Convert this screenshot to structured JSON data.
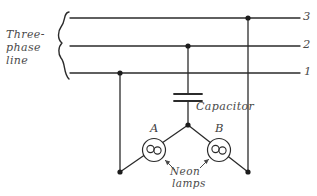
{
  "diagram": {
    "style": "hand-drawn line schematic",
    "background_color": "#ffffff",
    "ink_color": "#2b2b2b",
    "text_color": "#4a4a4a",
    "labels": {
      "three_phase_line_1": "Three-",
      "three_phase_line_2": "phase",
      "three_phase_line_3": "line",
      "terminal_3": "3",
      "terminal_2": "2",
      "terminal_1": "1",
      "capacitor": "Capacitor",
      "lamp_a": "A",
      "lamp_b": "B",
      "neon_lamps_line_1": "Neon",
      "neon_lamps_line_2": "lamps"
    },
    "components": [
      {
        "name": "capacitor",
        "type": "capacitor",
        "label": "Capacitor",
        "connects": [
          "line-2",
          "star-node"
        ]
      },
      {
        "name": "neon-lamp-a",
        "type": "neon-lamp",
        "label": "A",
        "connects": [
          "star-node",
          "line-1"
        ]
      },
      {
        "name": "neon-lamp-b",
        "type": "neon-lamp",
        "label": "B",
        "connects": [
          "star-node",
          "line-3"
        ]
      }
    ],
    "bus_lines": [
      {
        "name": "line-3",
        "label": "3",
        "y": 18,
        "tap_x": 248
      },
      {
        "name": "line-2",
        "label": "2",
        "y": 46,
        "tap_x": 188
      },
      {
        "name": "line-1",
        "label": "1",
        "y": 73,
        "tap_x": 120
      }
    ],
    "junction_dots": [
      {
        "name": "tap-line-3",
        "x": 248,
        "y": 18
      },
      {
        "name": "tap-line-2",
        "x": 188,
        "y": 46
      },
      {
        "name": "tap-line-1",
        "x": 120,
        "y": 73
      },
      {
        "name": "star-node",
        "x": 188,
        "y": 125
      },
      {
        "name": "lamp-a-return",
        "x": 120,
        "y": 172
      },
      {
        "name": "lamp-b-return",
        "x": 248,
        "y": 172
      }
    ]
  }
}
